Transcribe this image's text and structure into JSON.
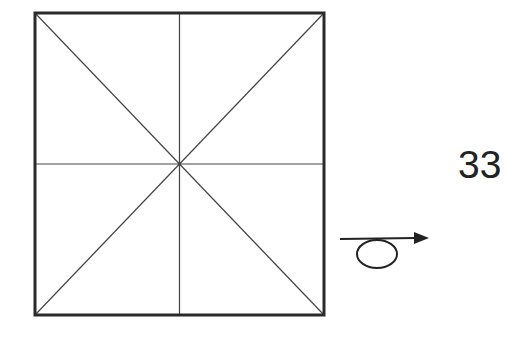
{
  "diagram": {
    "square": {
      "x": 35,
      "y": 13,
      "width": 289,
      "height": 302,
      "stroke": "#2a2a2a",
      "stroke_width": 3
    },
    "inner_lines": {
      "stroke": "#444444",
      "stroke_width": 1.2,
      "lines": [
        "vertical-center",
        "horizontal-center",
        "diagonal-tl-br",
        "diagonal-tr-bl"
      ]
    },
    "label": "33",
    "arrow_symbol": {
      "icon": "loop-arrow-right-icon",
      "stroke": "#222222"
    }
  }
}
